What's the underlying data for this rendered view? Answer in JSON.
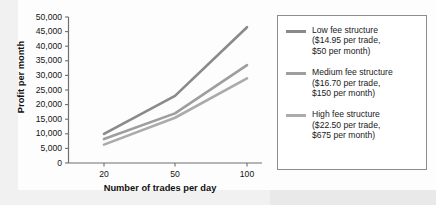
{
  "chart_data": {
    "type": "line",
    "title": "",
    "xlabel": "Number of trades per day",
    "ylabel": "Profit per month",
    "x": [
      20,
      50,
      100
    ],
    "x_tick_labels": [
      "20",
      "50",
      "100"
    ],
    "y_tick_labels": [
      "0",
      "5,000",
      "10,000",
      "15,000",
      "20,000",
      "25,000",
      "30,000",
      "35,000",
      "40,000",
      "45,000",
      "50,000"
    ],
    "y_ticks": [
      0,
      5000,
      10000,
      15000,
      20000,
      25000,
      30000,
      35000,
      40000,
      45000,
      50000
    ],
    "ylim": [
      0,
      50000
    ],
    "grid": false,
    "legend_position": "right",
    "series": [
      {
        "name": "Low fee structure",
        "detail_line1": "($14.95 per trade,",
        "detail_line2": "$50 per month)",
        "legend_text": "Low fee structure\n($14.95 per trade,\n$50 per month)",
        "color": "#8a8a8a",
        "values": [
          10000,
          23000,
          46500
        ]
      },
      {
        "name": "Medium fee structure",
        "detail_line1": "($16.70 per trade,",
        "detail_line2": "$150 per month)",
        "legend_text": "Medium fee structure\n($16.70 per trade,\n$150 per month)",
        "color": "#9e9e9e",
        "values": [
          8200,
          17000,
          33500
        ]
      },
      {
        "name": "High fee structure",
        "detail_line1": "($22.50 per trade,",
        "detail_line2": "$675 per month)",
        "legend_text": "High fee structure\n($22.50 per trade,\n$675 per month)",
        "color": "#ababab",
        "values": [
          6300,
          15500,
          29000
        ]
      }
    ]
  },
  "axis": {
    "ylabel": "Profit per month",
    "xlabel": "Number of trades per day",
    "yticks": [
      "50,000",
      "45,000",
      "40,000",
      "35,000",
      "30,000",
      "25,000",
      "20,000",
      "15,000",
      "10,000",
      "5,000",
      "0"
    ],
    "xticks": [
      "20",
      "50",
      "100"
    ]
  },
  "legend": {
    "entries": [
      {
        "text": "Low fee structure\n($14.95 per trade,\n$50 per month)",
        "color": "#8a8a8a"
      },
      {
        "text": "Medium fee structure\n($16.70 per trade,\n$150 per month)",
        "color": "#9e9e9e"
      },
      {
        "text": "High fee structure\n($22.50 per trade,\n$675 per month)",
        "color": "#ababab"
      }
    ]
  },
  "colors": {
    "axis": "#6e6e6e",
    "text": "#141414",
    "legend_border": "#8d8d8d",
    "background": "#fdfdfd"
  }
}
